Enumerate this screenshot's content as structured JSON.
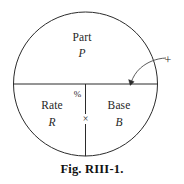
{
  "figure": {
    "caption": "Fig. RIII-1.",
    "background_color": "#ffffff",
    "line_color": "#2b2b2b",
    "text_color": "#1f1f1f",
    "geometry": {
      "circle_center_x": 85.5,
      "circle_center_y": 84,
      "circle_radius": 72,
      "horizontal_divider_y": 84,
      "vertical_divider_x": 85.5,
      "vertical_divider_top_y": 84,
      "vertical_divider_bottom_y": 156
    },
    "regions": {
      "top": {
        "name_label": "Part",
        "symbol_label": "P"
      },
      "bottom_left": {
        "name_label": "Rate",
        "symbol_label": "R"
      },
      "bottom_right": {
        "name_label": "Base",
        "symbol_label": "B"
      }
    },
    "operators": {
      "percent": "%",
      "multiply": "×"
    },
    "annotation": {
      "marker": "+",
      "marker_x": 168,
      "marker_y": 60,
      "arrow_tip_x": 130,
      "arrow_tip_y": 84
    }
  }
}
